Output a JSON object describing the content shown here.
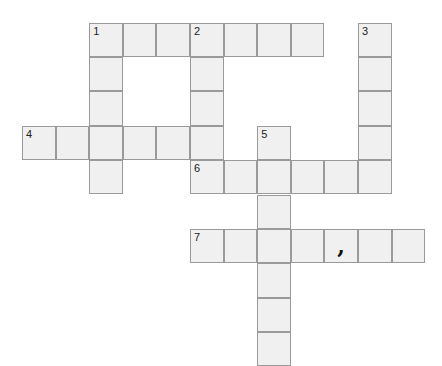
{
  "puzzle": {
    "type": "crossword",
    "grid": {
      "origin_x": 22,
      "origin_y": 22.5,
      "cell_w": 33.6,
      "cell_h": 34.4,
      "cell_color": "#f0f0f0",
      "border_color": "#9a9a9a"
    },
    "entries": [
      {
        "number": "1",
        "direction": "across",
        "row": 0,
        "col": 2,
        "length": 7
      },
      {
        "number": "1",
        "direction": "down",
        "row": 0,
        "col": 2,
        "length": 5
      },
      {
        "number": "2",
        "direction": "down",
        "row": 0,
        "col": 5,
        "length": 4
      },
      {
        "number": "3",
        "direction": "down",
        "row": 0,
        "col": 10,
        "length": 5
      },
      {
        "number": "4",
        "direction": "across",
        "row": 3,
        "col": 0,
        "length": 6
      },
      {
        "number": "5",
        "direction": "down",
        "row": 3,
        "col": 7,
        "length": 7
      },
      {
        "number": "6",
        "direction": "across",
        "row": 4,
        "col": 5,
        "length": 6
      },
      {
        "number": "7",
        "direction": "across",
        "row": 6,
        "col": 5,
        "length": 7
      }
    ],
    "prefilled": [
      {
        "row": 6,
        "col": 9,
        "text": ","
      }
    ]
  }
}
